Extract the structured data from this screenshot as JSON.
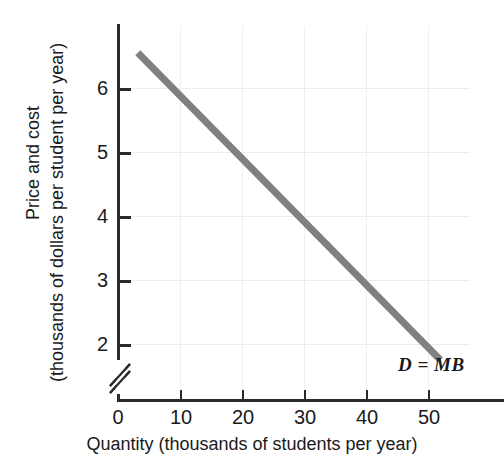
{
  "chart_data": {
    "type": "line",
    "title": "",
    "subtitle": "",
    "xlabel": "Quantity (thousands of students per year)",
    "ylabel_line1": "Price and cost",
    "ylabel_line2": "(thousands of dollars per student per year)",
    "xlim": [
      0,
      56
    ],
    "ylim": [
      1.5,
      7.0
    ],
    "y_axis_break": true,
    "y_axis_break_icon": "axis-break-slash",
    "grid": true,
    "grid_color": "#ececec",
    "legend": "none",
    "xticks": [
      {
        "value": 0,
        "label": "0"
      },
      {
        "value": 10,
        "label": "10"
      },
      {
        "value": 20,
        "label": "20"
      },
      {
        "value": 30,
        "label": "30"
      },
      {
        "value": 40,
        "label": "40"
      },
      {
        "value": 50,
        "label": "50"
      }
    ],
    "yticks": [
      {
        "value": 2,
        "label": "2"
      },
      {
        "value": 3,
        "label": "3"
      },
      {
        "value": 4,
        "label": "4"
      },
      {
        "value": 5,
        "label": "5"
      },
      {
        "value": 6,
        "label": "6"
      }
    ],
    "y_origin_label": "0",
    "series": [
      {
        "name": "D = MB",
        "annotation": "D = MB",
        "color": "#808080",
        "linewidth": 7,
        "x": [
          3.2,
          10,
          20,
          30,
          40,
          52
        ],
        "y": [
          6.55,
          5.88,
          4.89,
          3.91,
          2.92,
          1.75
        ],
        "points": [
          {
            "x": 3.2,
            "y": 6.55
          },
          {
            "x": 10,
            "y": 5.88
          },
          {
            "x": 20,
            "y": 4.89
          },
          {
            "x": 30,
            "y": 3.91
          },
          {
            "x": 40,
            "y": 2.92
          },
          {
            "x": 52,
            "y": 1.75
          }
        ]
      }
    ],
    "annotations": [
      {
        "text": "D = MB",
        "x": 45,
        "y": 1.35,
        "style": "italic-bold"
      }
    ],
    "colors": {
      "curve": "#808080",
      "axis": "#2b2b2b",
      "grid": "#ececec",
      "text": "#1a1a1a",
      "background": "#ffffff"
    }
  }
}
